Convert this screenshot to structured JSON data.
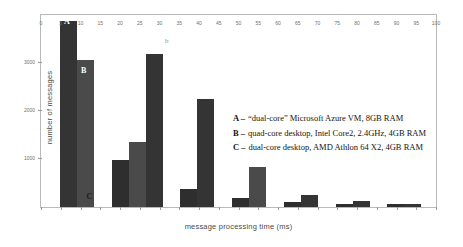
{
  "chart_data": {
    "type": "bar",
    "title": "",
    "xlabel": "message processing time (ms)",
    "ylabel": "number of messages",
    "panel_label": "b",
    "xlim": [
      0,
      100
    ],
    "ylim": [
      0,
      4000
    ],
    "grid": false,
    "legend_position": "inside-right",
    "x_ticks": [
      0,
      5,
      10,
      15,
      20,
      25,
      30,
      35,
      40,
      45,
      50,
      55,
      60,
      65,
      70,
      75,
      80,
      85,
      90,
      95,
      100
    ],
    "x_tick_labels": [
      "0",
      "5",
      "10",
      "15",
      "20",
      "25",
      "30",
      "35",
      "40",
      "45",
      "50",
      "55",
      "60",
      "65",
      "70",
      "75",
      "80",
      "85",
      "90",
      "95",
      "100"
    ],
    "y_ticks": [
      0,
      1000,
      2000,
      3000
    ],
    "y_tick_labels": [
      "0",
      "1000",
      "2000",
      "3000"
    ],
    "categories": [
      2.5,
      7.5,
      12.5,
      17.5,
      22.5,
      27.5,
      32.5,
      37.5,
      42.5,
      47.5,
      52.5,
      57.5,
      62.5,
      67.5,
      72.5,
      77.5,
      82.5,
      87.5,
      92.5,
      97.5
    ],
    "series": [
      {
        "name": "A",
        "label": "“dual-core” Microsoft Azure VM, 8GB RAM",
        "color": "#343434",
        "values": [
          3880,
          0,
          0,
          0,
          0,
          0,
          0,
          0,
          0,
          0,
          0,
          0,
          0,
          0,
          0,
          0,
          0,
          0,
          0,
          0
        ]
      },
      {
        "name": "B",
        "label": "quad-core desktop, Intel Core2, 2.4GHz, 4GB RAM",
        "color": "#4a4a4a",
        "values": [
          0,
          3000,
          0,
          0,
          0,
          0,
          0,
          0,
          0,
          0,
          0,
          0,
          0,
          0,
          0,
          0,
          0,
          0,
          0,
          0
        ]
      },
      {
        "name": "C",
        "label": "dual-core desktop, AMD Athlon 64 X2, 4GB RAM",
        "color": "#2e2e2e",
        "values": [
          0,
          0,
          0,
          0,
          0,
          0,
          0,
          0,
          0,
          0,
          0,
          0,
          0,
          0,
          0,
          0,
          0,
          0,
          0,
          0
        ]
      }
    ],
    "bars": [
      {
        "name": "bar-a-bin1",
        "x_left_pct": 4.8,
        "width_pct": 4.3,
        "height_pct": 97.0,
        "series": "a"
      },
      {
        "name": "bar-b-bin1",
        "x_left_pct": 9.1,
        "width_pct": 4.3,
        "height_pct": 76.5,
        "series": "b"
      },
      {
        "name": "bar-c-bin3",
        "x_left_pct": 17.9,
        "width_pct": 4.3,
        "height_pct": 24.5,
        "series": "c"
      },
      {
        "name": "bar-b-bin3",
        "x_left_pct": 22.2,
        "width_pct": 4.3,
        "height_pct": 34.0,
        "series": "b"
      },
      {
        "name": "bar-a-bin3",
        "x_left_pct": 26.5,
        "width_pct": 4.3,
        "height_pct": 79.5,
        "series": "a"
      },
      {
        "name": "bar-c-bin5",
        "x_left_pct": 35.3,
        "width_pct": 4.3,
        "height_pct": 9.5,
        "series": "c"
      },
      {
        "name": "bar-a-bin5",
        "x_left_pct": 39.6,
        "width_pct": 4.3,
        "height_pct": 56.0,
        "series": "a"
      },
      {
        "name": "bar-c-bin7",
        "x_left_pct": 48.4,
        "width_pct": 4.3,
        "height_pct": 4.5,
        "series": "c"
      },
      {
        "name": "bar-b-bin7",
        "x_left_pct": 52.7,
        "width_pct": 4.3,
        "height_pct": 21.0,
        "series": "b"
      },
      {
        "name": "bar-c-bin9",
        "x_left_pct": 61.5,
        "width_pct": 4.3,
        "height_pct": 2.5,
        "series": "c"
      },
      {
        "name": "bar-a-bin9",
        "x_left_pct": 65.8,
        "width_pct": 4.3,
        "height_pct": 6.0,
        "series": "a"
      },
      {
        "name": "bar-c-bin11",
        "x_left_pct": 74.6,
        "width_pct": 4.3,
        "height_pct": 1.8,
        "series": "c"
      },
      {
        "name": "bar-a-bin11",
        "x_left_pct": 78.9,
        "width_pct": 4.3,
        "height_pct": 3.2,
        "series": "a"
      },
      {
        "name": "bar-c-bin13",
        "x_left_pct": 87.7,
        "width_pct": 4.3,
        "height_pct": 1.4,
        "series": "c"
      },
      {
        "name": "bar-a-bin13",
        "x_left_pct": 92.0,
        "width_pct": 4.3,
        "height_pct": 1.4,
        "series": "a"
      }
    ],
    "bar_tags": [
      {
        "name": "bar-tag-a",
        "text": "A",
        "left_pct": 5.8,
        "top_px": 3,
        "dark": false
      },
      {
        "name": "bar-tag-b",
        "text": "B",
        "left_pct": 10.1,
        "top_px": 52,
        "dark": false
      },
      {
        "name": "bar-tag-c",
        "text": "C",
        "left_pct": 11.5,
        "top_px": 178,
        "dark": true
      }
    ]
  },
  "legend": {
    "rows": [
      {
        "key": "A",
        "dash": "–",
        "desc": "“dual-core” Microsoft Azure VM, 8GB RAM"
      },
      {
        "key": "B",
        "dash": "–",
        "desc": "quad-core desktop, Intel Core2, 2.4GHz, 4GB RAM"
      },
      {
        "key": "C",
        "dash": "–",
        "desc": "dual-core desktop, AMD Athlon 64 X2, 4GB RAM"
      }
    ]
  }
}
